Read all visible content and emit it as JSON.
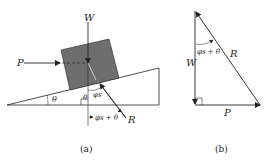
{
  "figure_a": {
    "caption": "(a)",
    "labels": {
      "W": "W",
      "P": "P",
      "R": "R",
      "theta_incline": "θ",
      "theta_normal": "θ",
      "phi_s": "φs",
      "phi_plus_theta": "φs + θ"
    }
  },
  "figure_b": {
    "caption": "(b)",
    "labels": {
      "W": "W",
      "R": "R",
      "P": "P",
      "phi_plus_theta": "φs + θ"
    }
  },
  "colors": {
    "block_fill": "#6e6e6e",
    "line": "#222222",
    "background": "#ffffff"
  }
}
